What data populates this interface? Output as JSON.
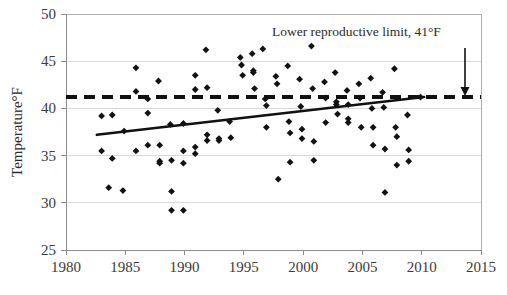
{
  "chart_data": {
    "type": "scatter",
    "title": "",
    "xlabel": "",
    "ylabel": "Temperature°F",
    "xlim": [
      1980,
      2015
    ],
    "ylim": [
      25,
      50
    ],
    "xticks": [
      1980,
      1985,
      1990,
      1995,
      2000,
      2005,
      2010,
      2015
    ],
    "yticks": [
      25,
      30,
      35,
      40,
      45,
      50
    ],
    "xtick_labels": [
      "1980",
      "1985",
      "1990",
      "1995",
      "2000",
      "2005",
      "2010",
      "2015"
    ],
    "ytick_labels": [
      "25",
      "30",
      "35",
      "40",
      "45",
      "50"
    ],
    "grid": "horizontal",
    "legend": "none",
    "series": [
      {
        "name": "Annual temperature observations",
        "marker": "diamond",
        "color": "#121212",
        "points": [
          [
            1983.0,
            39.2
          ],
          [
            1983.0,
            35.5
          ],
          [
            1983.6,
            31.6
          ],
          [
            1983.9,
            39.3
          ],
          [
            1983.9,
            34.7
          ],
          [
            1984.8,
            31.3
          ],
          [
            1984.9,
            37.6
          ],
          [
            1985.9,
            44.3
          ],
          [
            1985.9,
            41.8
          ],
          [
            1985.9,
            35.5
          ],
          [
            1986.9,
            41.0
          ],
          [
            1986.9,
            39.5
          ],
          [
            1986.9,
            36.1
          ],
          [
            1987.8,
            42.9
          ],
          [
            1987.9,
            36.1
          ],
          [
            1987.9,
            34.4
          ],
          [
            1987.9,
            34.2
          ],
          [
            1988.8,
            38.3
          ],
          [
            1988.9,
            34.5
          ],
          [
            1988.9,
            31.2
          ],
          [
            1988.9,
            29.2
          ],
          [
            1989.9,
            38.4
          ],
          [
            1989.9,
            35.5
          ],
          [
            1989.9,
            34.2
          ],
          [
            1989.9,
            29.2
          ],
          [
            1990.9,
            43.5
          ],
          [
            1990.9,
            42.0
          ],
          [
            1990.9,
            35.9
          ],
          [
            1990.9,
            35.2
          ],
          [
            1991.8,
            46.2
          ],
          [
            1991.9,
            42.2
          ],
          [
            1991.9,
            37.2
          ],
          [
            1991.9,
            36.6
          ],
          [
            1992.8,
            39.8
          ],
          [
            1992.9,
            36.8
          ],
          [
            1992.9,
            36.6
          ],
          [
            1993.8,
            38.6
          ],
          [
            1993.9,
            36.9
          ],
          [
            1994.7,
            45.4
          ],
          [
            1994.8,
            44.6
          ],
          [
            1994.9,
            43.5
          ],
          [
            1995.7,
            45.8
          ],
          [
            1995.8,
            44.0
          ],
          [
            1995.8,
            43.8
          ],
          [
            1995.9,
            42.1
          ],
          [
            1996.6,
            46.3
          ],
          [
            1996.8,
            41.0
          ],
          [
            1996.9,
            40.3
          ],
          [
            1996.9,
            38.0
          ],
          [
            1997.7,
            43.4
          ],
          [
            1997.8,
            42.6
          ],
          [
            1997.9,
            32.5
          ],
          [
            1998.7,
            44.5
          ],
          [
            1998.8,
            38.6
          ],
          [
            1998.9,
            37.4
          ],
          [
            1998.9,
            34.3
          ],
          [
            1999.7,
            43.1
          ],
          [
            1999.8,
            40.2
          ],
          [
            1999.9,
            37.8
          ],
          [
            1999.9,
            36.8
          ],
          [
            2000.7,
            46.6
          ],
          [
            2000.8,
            42.1
          ],
          [
            2000.9,
            36.5
          ],
          [
            2000.9,
            34.5
          ],
          [
            2001.8,
            42.8
          ],
          [
            2001.9,
            41.1
          ],
          [
            2001.9,
            38.5
          ],
          [
            2002.7,
            43.8
          ],
          [
            2002.8,
            40.7
          ],
          [
            2002.8,
            40.4
          ],
          [
            2002.9,
            39.4
          ],
          [
            2003.7,
            41.9
          ],
          [
            2003.8,
            40.4
          ],
          [
            2003.8,
            38.9
          ],
          [
            2003.8,
            38.5
          ],
          [
            2004.7,
            42.6
          ],
          [
            2004.8,
            41.1
          ],
          [
            2004.9,
            38.0
          ],
          [
            2005.7,
            43.2
          ],
          [
            2005.8,
            40.0
          ],
          [
            2005.9,
            38.0
          ],
          [
            2005.9,
            36.1
          ],
          [
            2006.7,
            41.7
          ],
          [
            2006.8,
            40.1
          ],
          [
            2006.9,
            35.7
          ],
          [
            2006.9,
            31.1
          ],
          [
            2007.7,
            44.2
          ],
          [
            2007.8,
            38.0
          ],
          [
            2007.9,
            37.0
          ],
          [
            2007.9,
            34.0
          ],
          [
            2008.8,
            39.3
          ],
          [
            2008.9,
            35.6
          ],
          [
            2008.9,
            34.4
          ],
          [
            2009.9,
            41.2
          ]
        ]
      }
    ],
    "trend_line": {
      "name": "Linear trend",
      "color": "#111111",
      "x_start": 1982.6,
      "y_start": 37.2,
      "x_end": 2010.2,
      "y_end": 41.2
    },
    "threshold_line": {
      "name": "Lower reproductive limit",
      "value": 41.2,
      "style": "dashed",
      "color": "#111111"
    },
    "annotations": [
      {
        "name": "lower-reproductive-limit-annotation",
        "text": "Lower reproductive limit, 41°F",
        "x_text": 272,
        "y_text": 36,
        "arrow_x": 465,
        "arrow_y_start": 48,
        "arrow_y_end": 96
      }
    ]
  },
  "geometry": {
    "plot_left": 66,
    "plot_right": 481,
    "plot_top": 14,
    "plot_bottom": 250
  }
}
